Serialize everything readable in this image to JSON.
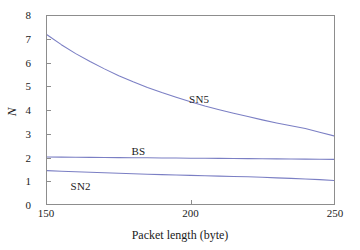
{
  "chart_data": {
    "type": "line",
    "title": "",
    "xlabel": "Packet length (byte)",
    "ylabel": "N",
    "xlim": [
      150,
      250
    ],
    "ylim": [
      0,
      8
    ],
    "xticks": [
      150,
      200,
      250
    ],
    "yticks": [
      0,
      1,
      2,
      3,
      4,
      5,
      6,
      7,
      8
    ],
    "grid": false,
    "legend_position": "inline-annotations",
    "line_color": "#7b7fc4",
    "axis_color": "#8d8d8d",
    "background": "#ffffff",
    "x": [
      150,
      155,
      160,
      165,
      170,
      175,
      180,
      185,
      190,
      195,
      200,
      205,
      210,
      215,
      220,
      225,
      230,
      235,
      240,
      245,
      250
    ],
    "series": [
      {
        "name": "SN5",
        "values": [
          7.2,
          6.78,
          6.4,
          6.06,
          5.75,
          5.46,
          5.2,
          4.96,
          4.74,
          4.54,
          4.35,
          4.17,
          4.01,
          3.86,
          3.72,
          3.58,
          3.45,
          3.33,
          3.21,
          3.05,
          2.9
        ],
        "label_x": 203,
        "label_y": 4.45
      },
      {
        "name": "BS",
        "values": [
          2.0,
          1.995,
          1.99,
          1.985,
          1.98,
          1.975,
          1.97,
          1.965,
          1.96,
          1.955,
          1.95,
          1.945,
          1.94,
          1.935,
          1.93,
          1.925,
          1.92,
          1.915,
          1.91,
          1.905,
          1.9
        ],
        "label_x": 182,
        "label_y": 2.28
      },
      {
        "name": "SN2",
        "values": [
          1.42,
          1.395,
          1.37,
          1.348,
          1.327,
          1.307,
          1.288,
          1.269,
          1.251,
          1.234,
          1.218,
          1.202,
          1.187,
          1.172,
          1.158,
          1.135,
          1.112,
          1.09,
          1.066,
          1.036,
          1.0
        ],
        "label_x": 162,
        "label_y": 0.8
      }
    ],
    "annotations": [
      {
        "text": "SN5"
      },
      {
        "text": "BS"
      },
      {
        "text": "SN2"
      }
    ]
  },
  "figure": {
    "alt": "Line chart of N versus packet length for SN5, BS and SN2"
  }
}
